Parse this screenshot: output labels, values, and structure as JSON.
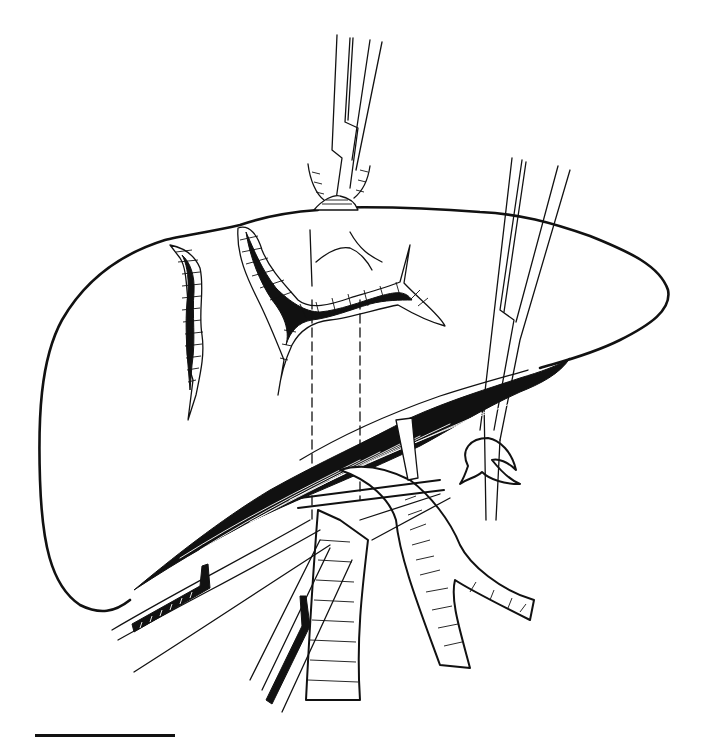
{
  "figure": {
    "type": "medical line illustration",
    "colors": {
      "ink": "#111111",
      "background": "#ffffff"
    },
    "elements": [
      "liver-outline",
      "laceration-left",
      "laceration-center",
      "forceps-top",
      "forceps-right",
      "hilar-vessels",
      "portal-vein",
      "vena-cava",
      "clamps-lower-left",
      "scale-bar"
    ]
  }
}
